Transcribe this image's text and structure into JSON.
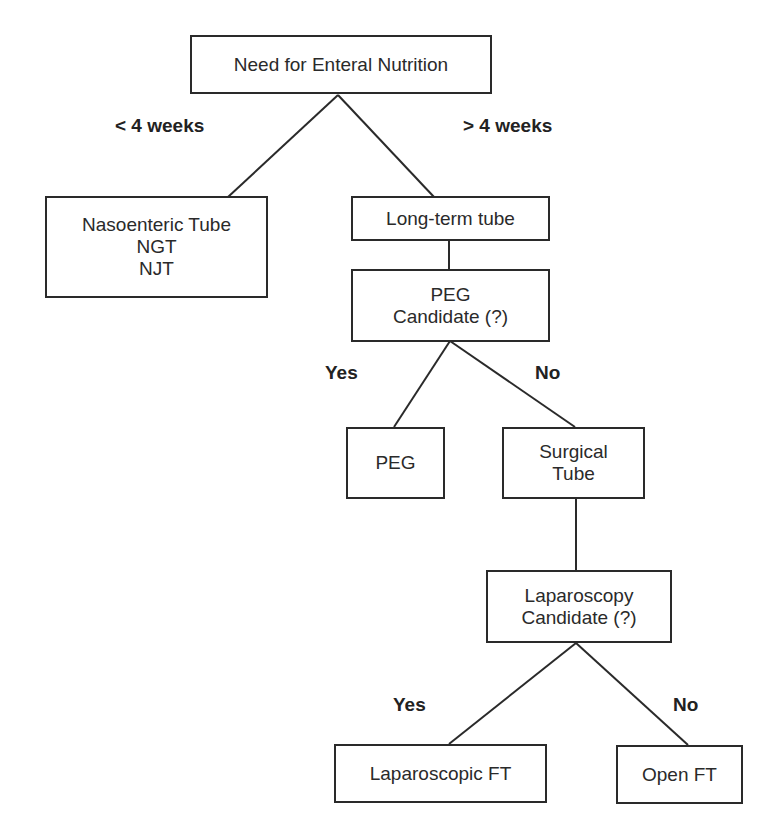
{
  "diagram": {
    "title": "Need for Enteral Nutrition",
    "nodes": {
      "root": {
        "lines": [
          "Need for Enteral Nutrition"
        ]
      },
      "nasoenteric": {
        "lines": [
          "Nasoenteric Tube",
          "NGT",
          "NJT"
        ]
      },
      "long_term": {
        "lines": [
          "Long-term tube"
        ]
      },
      "peg_candidate": {
        "lines": [
          "PEG",
          "Candidate (?)"
        ]
      },
      "peg": {
        "lines": [
          "PEG"
        ]
      },
      "surgical": {
        "lines": [
          "Surgical",
          "Tube"
        ]
      },
      "lap_candidate": {
        "lines": [
          "Laparoscopy",
          "Candidate (?)"
        ]
      },
      "lap_ft": {
        "lines": [
          "Laparoscopic FT"
        ]
      },
      "open_ft": {
        "lines": [
          "Open FT"
        ]
      }
    },
    "edge_labels": {
      "lt4": "< 4 weeks",
      "gt4": "> 4 weeks",
      "peg_yes": "Yes",
      "peg_no": "No",
      "lap_yes": "Yes",
      "lap_no": "No"
    },
    "edges": [
      {
        "from": "root",
        "to": "nasoenteric",
        "label": "< 4 weeks"
      },
      {
        "from": "root",
        "to": "long_term",
        "label": "> 4 weeks"
      },
      {
        "from": "long_term",
        "to": "peg_candidate",
        "label": ""
      },
      {
        "from": "peg_candidate",
        "to": "peg",
        "label": "Yes"
      },
      {
        "from": "peg_candidate",
        "to": "surgical",
        "label": "No"
      },
      {
        "from": "surgical",
        "to": "lap_candidate",
        "label": ""
      },
      {
        "from": "lap_candidate",
        "to": "lap_ft",
        "label": "Yes"
      },
      {
        "from": "lap_candidate",
        "to": "open_ft",
        "label": "No"
      }
    ],
    "colors": {
      "stroke": "#2a2a2a",
      "background": "#ffffff"
    }
  }
}
